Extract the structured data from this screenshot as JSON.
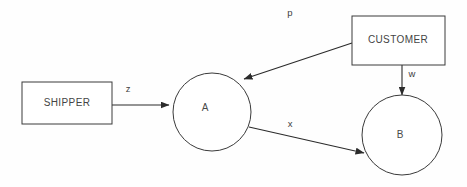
{
  "diagram": {
    "background_color": "#fefefe",
    "stroke_color": "#2b2b2b",
    "text_color": "#444444",
    "nodes": [
      {
        "id": "shipper",
        "label": "SHIPPER",
        "shape": "rectangle",
        "x": 22,
        "y": 82,
        "width": 90,
        "height": 42,
        "label_x": 67,
        "label_y": 103
      },
      {
        "id": "a",
        "label": "A",
        "shape": "circle",
        "cx": 212,
        "cy": 112,
        "r": 39,
        "label_x": 205,
        "label_y": 108
      },
      {
        "id": "customer",
        "label": "CUSTOMER",
        "shape": "rectangle",
        "x": 352,
        "y": 16,
        "width": 93,
        "height": 49,
        "label_x": 398,
        "label_y": 40
      },
      {
        "id": "b",
        "label": "B",
        "shape": "circle",
        "cx": 402,
        "cy": 135,
        "r": 40,
        "label_x": 400,
        "label_y": 135
      }
    ],
    "edges": [
      {
        "id": "z",
        "label": "z",
        "from": "shipper",
        "to": "a",
        "x1": 112,
        "y1": 105,
        "x2": 169,
        "y2": 105,
        "label_x": 128,
        "label_y": 89
      },
      {
        "id": "p",
        "label": "p",
        "from": "customer",
        "to": "a",
        "x1": 352,
        "y1": 43,
        "x2": 244,
        "y2": 79,
        "label_x": 290,
        "label_y": 13
      },
      {
        "id": "x",
        "label": "x",
        "from": "a",
        "to": "b",
        "x1": 249,
        "y1": 127,
        "x2": 364,
        "y2": 153,
        "label_x": 290,
        "label_y": 124
      },
      {
        "id": "w",
        "label": "w",
        "from": "customer",
        "to": "b",
        "x1": 402,
        "y1": 65,
        "x2": 402,
        "y2": 95,
        "label_x": 412,
        "label_y": 74
      }
    ]
  }
}
